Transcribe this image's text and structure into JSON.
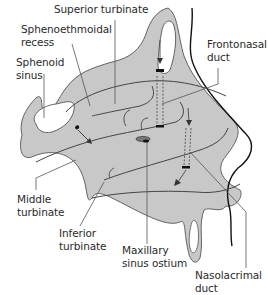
{
  "diagram": {
    "colors": {
      "tissue_fill": "#c8c8c8",
      "outline": "#3a3a3a",
      "label_text": "#2a2a2a",
      "background": "#ffffff"
    },
    "labels": {
      "superior_turbinate": "Superior turbinate",
      "sphenoethmoidal_recess_1": "Sphenoethmoidal",
      "sphenoethmoidal_recess_2": "recess",
      "sphenoid_sinus_1": "Sphenoid",
      "sphenoid_sinus_2": "sinus",
      "frontonasal_duct_1": "Frontonasal",
      "frontonasal_duct_2": "duct",
      "middle_turbinate_1": "Middle",
      "middle_turbinate_2": "turbinate",
      "inferior_turbinate_1": "Inferior",
      "inferior_turbinate_2": "turbinate",
      "maxillary_sinus_ostium_1": "Maxillary",
      "maxillary_sinus_ostium_2": "sinus ostium",
      "nasolacrimal_duct_1": "Nasolacrimal",
      "nasolacrimal_duct_2": "duct"
    }
  }
}
